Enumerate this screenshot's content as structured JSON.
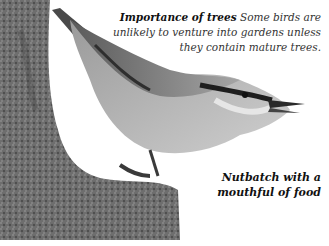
{
  "captions": {
    "importance": {
      "heading": "Importance of trees",
      "body": "Some birds are unlikely to venture into gardens unless they contain mature trees."
    },
    "photo": {
      "text": "Nutbatch with a mouthful of food"
    }
  },
  "image": {
    "subject": "nuthatch-on-tree-trunk",
    "colors": {
      "bark": "#6b6b6b",
      "bird_back": "#8a8a8a",
      "bird_belly": "#bdbdbd",
      "eye_stripe": "#1e1e1e"
    }
  }
}
